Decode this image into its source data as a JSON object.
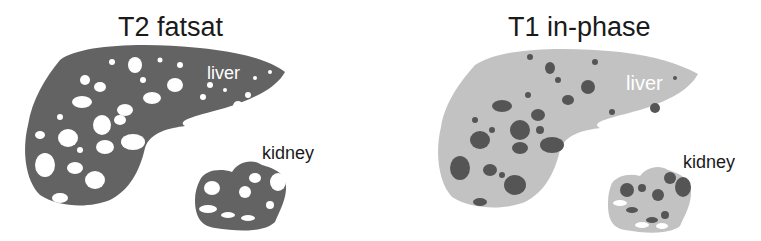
{
  "panels": [
    {
      "title": "T2 fatsat",
      "organ_labels": {
        "liver": "liver",
        "kidney": "kidney"
      },
      "colors": {
        "tissue": "#636363",
        "lesions": "#ffffff"
      }
    },
    {
      "title": "T1 in-phase",
      "organ_labels": {
        "liver": "liver",
        "kidney": "kidney"
      },
      "colors": {
        "tissue": "#c2c2c2",
        "lesions": "#555555"
      }
    }
  ]
}
